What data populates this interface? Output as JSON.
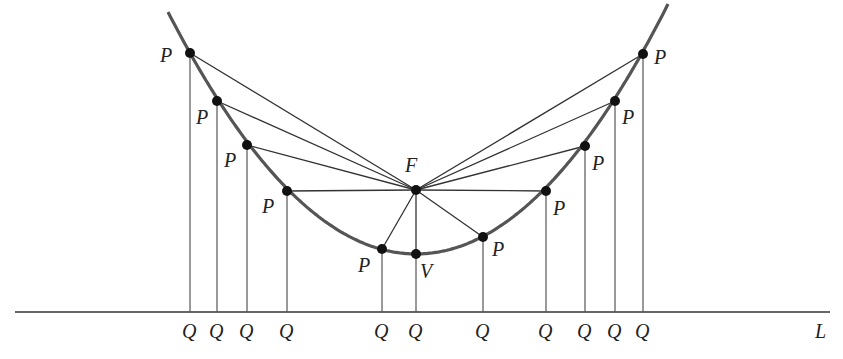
{
  "diagram": {
    "colors": {
      "curve": "#555555",
      "line": "#333333",
      "point": "#111111",
      "label": "#222222"
    },
    "directrix": {
      "label": "L",
      "y": 312,
      "x1": 15,
      "x2": 830,
      "label_x": 815,
      "label_y": 338
    },
    "focus": {
      "label": "F",
      "x": 416,
      "y": 190,
      "label_x": 405,
      "label_y": 172
    },
    "vertex": {
      "label": "V",
      "x": 416,
      "y": 254,
      "label_x": 420,
      "label_y": 278
    },
    "points": [
      {
        "label": "P",
        "x": 190,
        "y": 53,
        "label_x": 160,
        "label_y": 62
      },
      {
        "label": "P",
        "x": 217,
        "y": 101,
        "label_x": 196,
        "label_y": 124
      },
      {
        "label": "P",
        "x": 247,
        "y": 145,
        "label_x": 224,
        "label_y": 167
      },
      {
        "label": "P",
        "x": 287,
        "y": 191,
        "label_x": 262,
        "label_y": 213
      },
      {
        "label": "P",
        "x": 382,
        "y": 249,
        "label_x": 358,
        "label_y": 272
      },
      {
        "label": "P",
        "x": 483,
        "y": 237,
        "label_x": 492,
        "label_y": 256
      },
      {
        "label": "P",
        "x": 546,
        "y": 191,
        "label_x": 553,
        "label_y": 215
      },
      {
        "label": "P",
        "x": 585,
        "y": 146,
        "label_x": 592,
        "label_y": 170
      },
      {
        "label": "P",
        "x": 615,
        "y": 101,
        "label_x": 622,
        "label_y": 124
      },
      {
        "label": "P",
        "x": 643,
        "y": 54,
        "label_x": 654,
        "label_y": 64
      }
    ],
    "q_labels": [
      {
        "label": "Q",
        "x": 190
      },
      {
        "label": "Q",
        "x": 217
      },
      {
        "label": "Q",
        "x": 247
      },
      {
        "label": "Q",
        "x": 287
      },
      {
        "label": "Q",
        "x": 382
      },
      {
        "label": "Q",
        "x": 416
      },
      {
        "label": "Q",
        "x": 483
      },
      {
        "label": "Q",
        "x": 546
      },
      {
        "label": "Q",
        "x": 585
      },
      {
        "label": "Q",
        "x": 615
      },
      {
        "label": "Q",
        "x": 643
      }
    ],
    "q_label_y": 338
  }
}
